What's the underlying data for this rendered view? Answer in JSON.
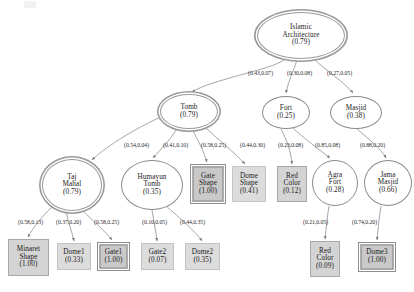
{
  "diagram": {
    "artifact_label": "",
    "colors": {
      "edge": "#8a8a8a",
      "node_fill_shaded": "#d4d4d4",
      "node_fill_light": "#dcdcdc",
      "node_border": "#8a8a8a",
      "text": "#1b1b1b"
    },
    "nodes": [
      {
        "id": "islamic",
        "shape": "ellipse",
        "style": "double",
        "lines": [
          "Islamic",
          "Architecture",
          "(0.79)"
        ],
        "x": 257,
        "y": 12,
        "w": 88,
        "h": 47
      },
      {
        "id": "tomb",
        "shape": "ellipse",
        "style": "double",
        "lines": [
          "Tomb",
          "(0.79)"
        ],
        "x": 160,
        "y": 94,
        "w": 58,
        "h": 35
      },
      {
        "id": "fort",
        "shape": "ellipse",
        "style": "single",
        "lines": [
          "Fort",
          "(0.25)"
        ],
        "x": 262,
        "y": 96,
        "w": 48,
        "h": 33
      },
      {
        "id": "masjid",
        "shape": "ellipse",
        "style": "single",
        "lines": [
          "Masjid",
          "(0.38)"
        ],
        "x": 330,
        "y": 96,
        "w": 52,
        "h": 33
      },
      {
        "id": "taj",
        "shape": "ellipse",
        "style": "double",
        "lines": [
          "Taj",
          "Mahal",
          "(0.79)"
        ],
        "x": 42,
        "y": 159,
        "w": 60,
        "h": 52
      },
      {
        "id": "humayun",
        "shape": "ellipse",
        "style": "single",
        "lines": [
          "Humayun",
          "Tomb",
          "(0.35)"
        ],
        "x": 121,
        "y": 160,
        "w": 62,
        "h": 50
      },
      {
        "id": "gate_shape",
        "shape": "rect",
        "style": "double",
        "lines": [
          "Gate",
          "Shape",
          "(1.00)"
        ],
        "x": 190,
        "y": 164,
        "w": 36,
        "h": 40
      },
      {
        "id": "dome_shape",
        "shape": "rect",
        "style": "light",
        "lines": [
          "Dome",
          "Shape",
          "(0.41)"
        ],
        "x": 232,
        "y": 166,
        "w": 34,
        "h": 36
      },
      {
        "id": "red_color_fort",
        "shape": "rect",
        "style": "shaded",
        "lines": [
          "Red",
          "Color",
          "(0.12)"
        ],
        "x": 277,
        "y": 166,
        "w": 30,
        "h": 36
      },
      {
        "id": "agra_fort",
        "shape": "ellipse",
        "style": "single",
        "lines": [
          "Agra",
          "Fort",
          "(0.28)"
        ],
        "x": 312,
        "y": 160,
        "w": 46,
        "h": 46
      },
      {
        "id": "jama_masjid",
        "shape": "ellipse",
        "style": "single",
        "lines": [
          "Jama",
          "Masjid",
          "(0.66)"
        ],
        "x": 364,
        "y": 160,
        "w": 48,
        "h": 46
      },
      {
        "id": "minaret_shape",
        "shape": "rect",
        "style": "shaded",
        "lines": [
          "Minaret",
          "Shape",
          "(1.00)"
        ],
        "x": 8,
        "y": 239,
        "w": 41,
        "h": 37
      },
      {
        "id": "dome1",
        "shape": "rect",
        "style": "light",
        "lines": [
          "Dome1",
          "(0.33)"
        ],
        "x": 57,
        "y": 243,
        "w": 34,
        "h": 27
      },
      {
        "id": "gate1",
        "shape": "rect",
        "style": "double",
        "lines": [
          "Gate1",
          "(1.00)"
        ],
        "x": 97,
        "y": 242,
        "w": 33,
        "h": 29
      },
      {
        "id": "gate2",
        "shape": "rect",
        "style": "light",
        "lines": [
          "Gate2",
          "(0.07)"
        ],
        "x": 141,
        "y": 243,
        "w": 33,
        "h": 27
      },
      {
        "id": "dome2",
        "shape": "rect",
        "style": "light",
        "lines": [
          "Dome2",
          "(0.35)"
        ],
        "x": 185,
        "y": 243,
        "w": 35,
        "h": 27
      },
      {
        "id": "red_color_agra",
        "shape": "rect",
        "style": "shaded",
        "lines": [
          "Red",
          "Color",
          "(0.09)"
        ],
        "x": 310,
        "y": 241,
        "w": 30,
        "h": 36
      },
      {
        "id": "dome3",
        "shape": "rect",
        "style": "double",
        "lines": [
          "Dome3",
          "(1.00)"
        ],
        "x": 358,
        "y": 242,
        "w": 38,
        "h": 30
      }
    ],
    "edges": [
      {
        "from": "islamic",
        "to": "tomb",
        "label": "(0.43,0.07)",
        "lx": 248,
        "ly": 70
      },
      {
        "from": "islamic",
        "to": "fort",
        "label": "(0.30,0.08)",
        "lx": 287,
        "ly": 70
      },
      {
        "from": "islamic",
        "to": "masjid",
        "label": "(0.27,0.05)",
        "lx": 327,
        "ly": 70
      },
      {
        "from": "tomb",
        "to": "taj",
        "label": "(0.54,0.04)",
        "lx": 124,
        "ly": 142
      },
      {
        "from": "tomb",
        "to": "humayun",
        "label": "(0.41,0.10)",
        "lx": 163,
        "ly": 142
      },
      {
        "from": "tomb",
        "to": "gate_shape",
        "label": "(0.58,0.25)",
        "lx": 201,
        "ly": 142
      },
      {
        "from": "tomb",
        "to": "dome_shape",
        "label": "(0.44,0.30)",
        "lx": 240,
        "ly": 142
      },
      {
        "from": "fort",
        "to": "red_color_fort",
        "label": "(0.23,0.08)",
        "lx": 278,
        "ly": 142
      },
      {
        "from": "fort",
        "to": "agra_fort",
        "label": "(0.85,0.08)",
        "lx": 315,
        "ly": 142
      },
      {
        "from": "masjid",
        "to": "jama_masjid",
        "label": "(0.88,0.20)",
        "lx": 360,
        "ly": 142
      },
      {
        "from": "taj",
        "to": "minaret_shape",
        "label": "(0.58,0.13)",
        "lx": 18,
        "ly": 219
      },
      {
        "from": "taj",
        "to": "dome1",
        "label": "(0.37,0.20)",
        "lx": 56,
        "ly": 219
      },
      {
        "from": "taj",
        "to": "gate1",
        "label": "(0.58,0.25)",
        "lx": 94,
        "ly": 219
      },
      {
        "from": "humayun",
        "to": "gate2",
        "label": "(0.10,0.05)",
        "lx": 142,
        "ly": 219
      },
      {
        "from": "humayun",
        "to": "dome2",
        "label": "(0.44,0.35)",
        "lx": 180,
        "ly": 219
      },
      {
        "from": "agra_fort",
        "to": "red_color_agra",
        "label": "(0.21,0.05)",
        "lx": 303,
        "ly": 219
      },
      {
        "from": "jama_masjid",
        "to": "dome3",
        "label": "(0.74,0.20)",
        "lx": 352,
        "ly": 219
      }
    ]
  }
}
